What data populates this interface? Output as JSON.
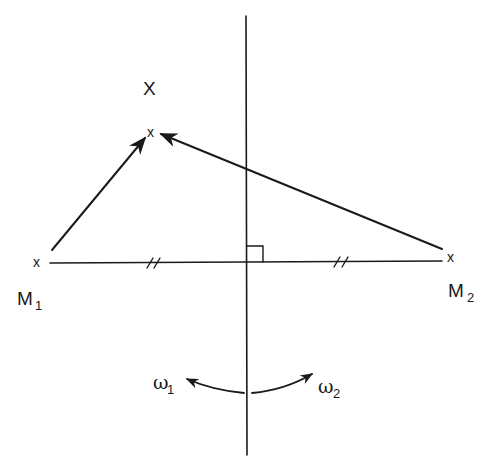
{
  "diagram": {
    "title": "",
    "labels": {
      "X": "X",
      "M1": "M",
      "M1_sub": "1",
      "M2": "M",
      "M2_sub": "2",
      "omega1": "ω",
      "omega1_sub": "1",
      "omega2": "ω",
      "omega2_sub": "2"
    },
    "markers": {
      "point_x": "x",
      "m1_x": "x",
      "m2_x": "x"
    },
    "elements": {
      "mirror_line": "vertical axis of symmetry",
      "base_segment": "segment M1–M2 bisected by axis, equal halves marked //",
      "right_angle": "right-angle marker at axis/segment intersection",
      "arrow_m1_to_x": "vector from M1 to point x",
      "arrow_m2_to_x": "vector from M2 to point x",
      "rotation_omega1": "curved arrow rotating left (ω1)",
      "rotation_omega2": "curved arrow rotating right (ω2)"
    },
    "colors": {
      "ink": "#1a1a1a",
      "background": "#ffffff"
    }
  }
}
